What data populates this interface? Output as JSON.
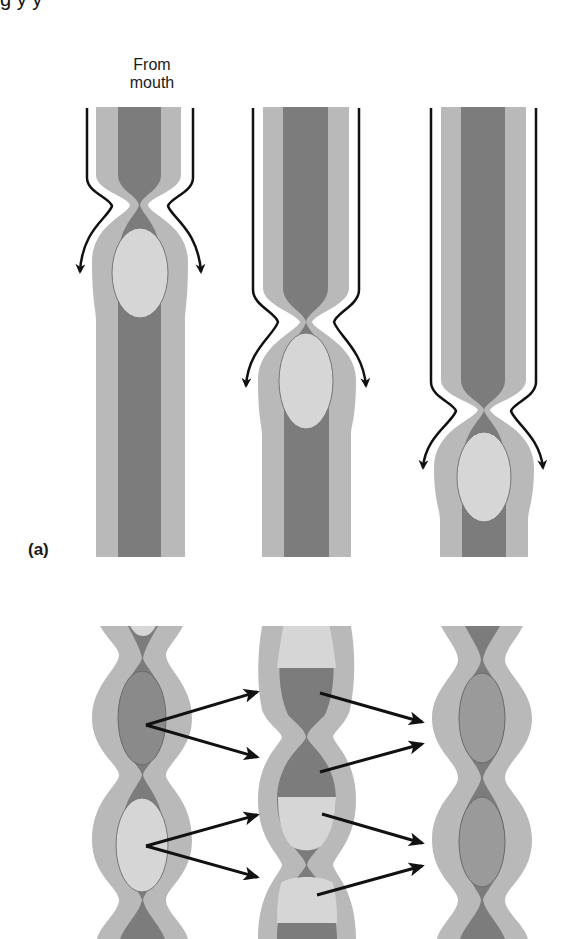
{
  "figure": {
    "cutoff_text": "g                    y                                                    y",
    "label_from_mouth_line1": "From",
    "label_from_mouth_line2": "mouth",
    "panel_a_label": "(a)",
    "panels": [
      {
        "id": "a",
        "description": "Peristalsis: constriction moves bolus down a tube, three successive stages"
      },
      {
        "id": "b",
        "description": "Segmentation: alternating contractions mixing contents, three successive stages with arrows"
      }
    ]
  },
  "colors": {
    "wall_light_gray": "#b9b9b9",
    "lumen_dark_gray": "#7c7c7c",
    "bolus_light": "#d6d6d6",
    "outline": "#111111",
    "background": "#ffffff"
  }
}
